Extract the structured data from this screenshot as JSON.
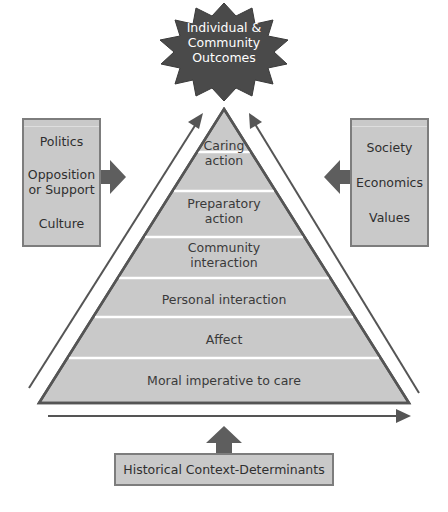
{
  "outcome": {
    "line1": "Individual &",
    "line2": "Community",
    "line3": "Outcomes"
  },
  "pyramid": {
    "levels": [
      {
        "line1": "Caring",
        "line2": "action"
      },
      {
        "line1": "Preparatory",
        "line2": "action"
      },
      {
        "line1": "Community",
        "line2": "interaction"
      },
      {
        "label": "Personal interaction"
      },
      {
        "label": "Affect"
      },
      {
        "label": "Moral imperative to care"
      }
    ]
  },
  "left_box": {
    "items": [
      {
        "line1": "Politics"
      },
      {
        "line1": "Opposition",
        "line2": "or Support"
      },
      {
        "line1": "Culture"
      }
    ]
  },
  "right_box": {
    "items": [
      {
        "line1": "Society"
      },
      {
        "line1": "Economics"
      },
      {
        "line1": "Values"
      }
    ]
  },
  "bottom_box": {
    "label": "Historical Context-Determinants"
  },
  "colors": {
    "fill": "#c9c9c9",
    "stroke": "#555555",
    "arrow": "#5e5e5e",
    "star": "#4a4a4a",
    "divider": "#ffffff"
  }
}
